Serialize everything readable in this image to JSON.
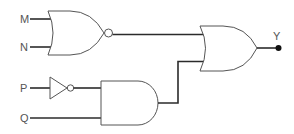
{
  "diagram": {
    "type": "logic-circuit",
    "inputs": [
      {
        "label": "M",
        "x": 22,
        "y": 23
      },
      {
        "label": "N",
        "x": 22,
        "y": 51
      },
      {
        "label": "P",
        "x": 22,
        "y": 92
      },
      {
        "label": "Q",
        "x": 22,
        "y": 122
      }
    ],
    "output": {
      "label": "Y"
    },
    "gates": [
      {
        "id": "g1",
        "type": "NOR",
        "inputs": [
          "M",
          "N"
        ]
      },
      {
        "id": "g2",
        "type": "NOT",
        "inputs": [
          "P"
        ]
      },
      {
        "id": "g3",
        "type": "AND",
        "inputs": [
          "g2",
          "Q"
        ]
      },
      {
        "id": "g4",
        "type": "OR",
        "inputs": [
          "g1",
          "g3"
        ],
        "output": "Y"
      }
    ],
    "expression": "Y = (M + N)' + (P' · Q)"
  },
  "colors": {
    "wire": "#2b2b2b",
    "gate_outline": "#555555",
    "label": "#555555",
    "output_dot": "#111111"
  }
}
